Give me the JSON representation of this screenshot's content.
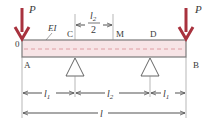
{
  "diagram": {
    "type": "beam",
    "colors": {
      "beam_fill": "#f7e4e6",
      "beam_outline": "#7a7a7a",
      "centerline": "#d98a93",
      "load_arrow": "#a8323e",
      "dim_line": "#555555",
      "text": "#3a3a3a"
    },
    "labels": {
      "load_left": "P",
      "load_right": "P",
      "origin": "0",
      "stiffness": "EI",
      "point_c": "C",
      "point_m": "M",
      "point_d": "D",
      "point_a": "A",
      "point_b": "B",
      "half_span_num": "l",
      "half_span_sub": "2",
      "half_span_den": "2",
      "dim_l1_left": "l",
      "dim_l1_left_sub": "1",
      "dim_l2": "l",
      "dim_l2_sub": "2",
      "dim_l1_right": "l",
      "dim_l1_right_sub": "1",
      "dim_total": "l"
    }
  }
}
